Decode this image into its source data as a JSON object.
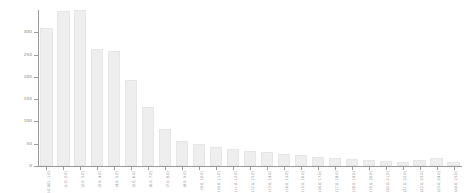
{
  "chart_data": {
    "type": "bar",
    "title": "",
    "subtitle": "",
    "xlabel": "",
    "ylabel": "",
    "grid": false,
    "legend": null,
    "ylim": [
      0,
      350
    ],
    "yticks": [
      0,
      50,
      100,
      150,
      200,
      250,
      300
    ],
    "ytick_labels": [
      "0",
      "50",
      "100",
      "150",
      "200",
      "250",
      "300"
    ],
    "bar_color": "#eeeeee",
    "bar_edge_color": "#e6e6e6",
    "axis_color": "#9a9a9a",
    "tick_label_color": "#7d7d7d",
    "background": "#ffffff",
    "xtick_rotation": -90,
    "categories": [
      "(-0.001, 1.0]",
      "(1.0, 2.0]",
      "(2.0, 3.0]",
      "(3.0, 4.0]",
      "(4.0, 5.0]",
      "(5.0, 6.0]",
      "(6.0, 7.0]",
      "(7.0, 8.0]",
      "(8.0, 9.0]",
      "(9.0, 10.0]",
      "(10.0, 11.0]",
      "(11.0, 12.0]",
      "(12.0, 13.0]",
      "(13.0, 14.0]",
      "(14.0, 15.0]",
      "(15.0, 16.0]",
      "(16.0, 17.0]",
      "(17.0, 18.0]",
      "(18.0, 19.0]",
      "(19.0, 20.0]",
      "(20.0, 21.0]",
      "(21.0, 22.0]",
      "(22.0, 23.0]",
      "(23.0, 24.0]",
      "(24.0, 25.0]"
    ],
    "values": [
      310,
      348,
      350,
      262,
      257,
      193,
      133,
      84,
      57,
      50,
      42,
      38,
      34,
      31,
      27,
      24,
      21,
      18,
      16,
      14,
      11,
      9,
      14,
      18,
      9
    ]
  }
}
